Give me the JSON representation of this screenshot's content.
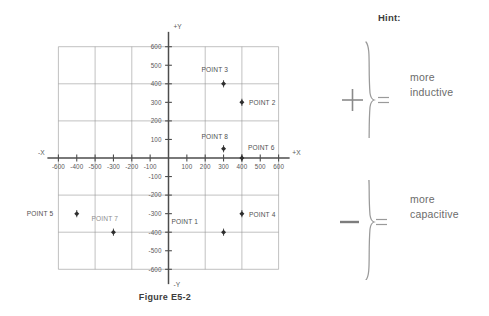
{
  "figure": {
    "caption": "Figure E5-2",
    "axis_labels": {
      "x_positive": "+X",
      "x_negative": "-X",
      "y_positive": "+Y",
      "y_negative": "-Y"
    }
  },
  "hint": {
    "title": "Hint:",
    "rows": [
      {
        "sign": "+",
        "equals": "=",
        "line1": "more",
        "line2": "inductive"
      },
      {
        "sign": "−",
        "equals": "=",
        "line1": "more",
        "line2": "capacitive"
      }
    ]
  },
  "chart_data": {
    "type": "scatter",
    "title": "Figure E5-2",
    "xlabel": "+X",
    "ylabel": "+Y",
    "xlim": [
      -650,
      650
    ],
    "ylim": [
      -650,
      650
    ],
    "grid": true,
    "grid_spacing": 200,
    "tick_spacing": 100,
    "legend": "none",
    "x_tick_labels_negative": [
      "-600",
      "-400",
      "-500",
      "-300",
      "-200",
      "-100"
    ],
    "x_tick_labels_positive": [
      "100",
      "200",
      "300",
      "400",
      "500",
      "600"
    ],
    "y_tick_labels_positive": [
      "100",
      "200",
      "300",
      "400",
      "500",
      "600"
    ],
    "y_tick_labels_negative": [
      "-100",
      "-200",
      "-300",
      "-400",
      "-500",
      "-600"
    ],
    "points": [
      {
        "label": "POINT 1",
        "x": 300,
        "y": -400,
        "label_dx": -52,
        "label_dy": -8
      },
      {
        "label": "POINT 2",
        "x": 400,
        "y": 300,
        "label_dx": 7,
        "label_dy": 3
      },
      {
        "label": "POINT 3",
        "x": 300,
        "y": 400,
        "label_dx": -22,
        "label_dy": -12
      },
      {
        "label": "POINT 4",
        "x": 400,
        "y": -300,
        "label_dx": 7,
        "label_dy": 3
      },
      {
        "label": "POINT 5",
        "x": -500,
        "y": -300,
        "label_dx": -50,
        "label_dy": 2
      },
      {
        "label": "POINT 6",
        "x": 400,
        "y": 0,
        "label_dx": 6,
        "label_dy": -8
      },
      {
        "label": "POINT 7",
        "x": -300,
        "y": -400,
        "label_dx": -22,
        "label_dy": -11,
        "faded": true
      },
      {
        "label": "POINT 8",
        "x": 300,
        "y": 50,
        "label_dx": -22,
        "label_dy": -10
      }
    ]
  }
}
